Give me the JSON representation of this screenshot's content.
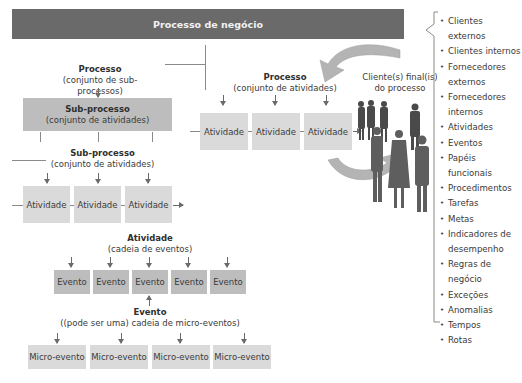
{
  "header": {
    "title": "Processo de negócio"
  },
  "process_top": {
    "title": "Processo",
    "subtitle": "(conjunto de sub-processos)"
  },
  "subprocess_box": {
    "title": "Sub-processo",
    "subtitle": "(conjunto de atividades)"
  },
  "subprocess_label": {
    "title": "Sub-processo",
    "subtitle": "(conjunto de atividades)"
  },
  "subprocess_activities": [
    "Atividade",
    "Atividade",
    "Atividade"
  ],
  "process_right": {
    "title": "Processo",
    "subtitle": "(conjunto de atividades)"
  },
  "process_activities": [
    "Atividade",
    "Atividade",
    "Atividade"
  ],
  "clients": {
    "line1": "Cliente(s) final(is)",
    "line2": "do processo"
  },
  "activity_label": {
    "title": "Atividade",
    "subtitle": "(cadeia de eventos)"
  },
  "events": [
    "Evento",
    "Evento",
    "Evento",
    "Evento",
    "Evento"
  ],
  "event_label": {
    "title": "Evento",
    "subtitle": "((pode ser uma) cadeia de micro-eventos)"
  },
  "micro_events": [
    "Micro-evento",
    "Micro-evento",
    "Micro-evento",
    "Micro-evento"
  ],
  "elements_list": [
    {
      "line1": "Clientes externos"
    },
    {
      "line1": "Clientes internos"
    },
    {
      "line1": "Fornecedores",
      "line2": "externos"
    },
    {
      "line1": "Fornecedores",
      "line2": "internos"
    },
    {
      "line1": "Atividades"
    },
    {
      "line1": "Eventos"
    },
    {
      "line1": "Papéis funcionais"
    },
    {
      "line1": "Procedimentos"
    },
    {
      "line1": "Tarefas"
    },
    {
      "line1": "Metas"
    },
    {
      "line1": "Indicadores de",
      "line2": "desempenho"
    },
    {
      "line1": "Regras de",
      "line2": "negócio"
    },
    {
      "line1": "Exceções"
    },
    {
      "line1": "Anomalias"
    },
    {
      "line1": "Tempos"
    },
    {
      "line1": "Rotas"
    }
  ],
  "colors": {
    "header_bg": "#6a6a6a",
    "box_light": "#dadada",
    "box_mid": "#bdbdbd",
    "cycle_arrow": "#b4b4b4",
    "figures": "#555555"
  }
}
